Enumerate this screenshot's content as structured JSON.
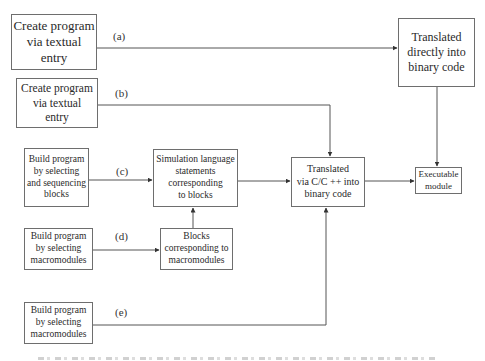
{
  "diagram": {
    "sources": {
      "a": {
        "lines": [
          "Create program",
          "via textual",
          "entry"
        ],
        "edge_label": "(a)"
      },
      "b": {
        "lines": [
          "Create program",
          "via textual",
          "entry"
        ],
        "edge_label": "(b)"
      },
      "c": {
        "lines": [
          "Build program",
          "by selecting",
          "and sequencing",
          "blocks"
        ],
        "edge_label": "(c)"
      },
      "d": {
        "lines": [
          "Build program",
          "by selecting",
          "macromodules"
        ],
        "edge_label": "(d)"
      },
      "e": {
        "lines": [
          "Build program",
          "by selecting",
          "macromodules"
        ],
        "edge_label": "(e)"
      }
    },
    "intermediate": {
      "simulation_statements": {
        "lines": [
          "Simulation language",
          "statements",
          "corresponding",
          "to  blocks"
        ]
      },
      "macromodule_blocks": {
        "lines": [
          "Blocks",
          "corresponding  to",
          "macromodules"
        ]
      }
    },
    "translators": {
      "direct_binary": {
        "lines": [
          "Translated",
          "directly into",
          "binary code"
        ]
      },
      "via_c": {
        "lines": [
          "Translated",
          "via  C/C ++  into",
          "binary  code"
        ]
      }
    },
    "target": {
      "lines": [
        "Executable",
        "module"
      ]
    }
  },
  "colors": {
    "line": "#555555",
    "border": "#6e6e6e",
    "text": "#2a2a2a"
  }
}
